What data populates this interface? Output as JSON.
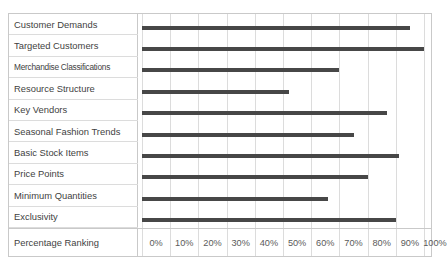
{
  "chart_data": {
    "type": "bar",
    "orientation": "horizontal",
    "title": "",
    "xlabel": "Percentage Ranking",
    "ylabel": "",
    "xlim": [
      0,
      100
    ],
    "grid": true,
    "legend": false,
    "categories": [
      "Customer Demands",
      "Targeted Customers",
      "Merchandise Classifications",
      "Resource Structure",
      "Key Vendors",
      "Seasonal Fashion Trends",
      "Basic Stock Items",
      "Price Points",
      "Minimum Quantities",
      "Exclusivity"
    ],
    "values": [
      95,
      100,
      70,
      52,
      87,
      75,
      91,
      80,
      66,
      90
    ],
    "tick_labels": [
      "0%",
      "10%",
      "20%",
      "30%",
      "40%",
      "50%",
      "60%",
      "70%",
      "80%",
      "90%",
      "100%"
    ],
    "tick_values": [
      0,
      10,
      20,
      30,
      40,
      50,
      60,
      70,
      80,
      90,
      100
    ],
    "bar_color": "#474747",
    "grid_color": "#dcdcdc",
    "border_color": "#c9c9c9",
    "background": "#ffffff"
  },
  "axis_row": {
    "label": "Percentage Ranking"
  }
}
